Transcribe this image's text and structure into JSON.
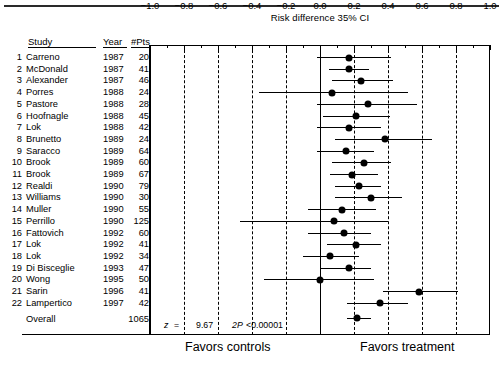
{
  "figure": {
    "title": "Risk difference 35% CI",
    "footer_left": "Favors controls",
    "footer_right": "Favors treatment",
    "overall_label": "Overall",
    "overall_pts": "1065",
    "stat_z_label": "z",
    "stat_eq": "=",
    "stat_z_value": "9.67",
    "stat_p_label": "2P",
    "stat_p_value": "<0.00001"
  },
  "columns": {
    "study": "Study",
    "year": "Year",
    "pts": "#Pts"
  },
  "chart_data": {
    "type": "forest",
    "title": "Risk difference 35% CI",
    "xlabel": "",
    "ylabel": "",
    "xlim": [
      -1.0,
      1.0
    ],
    "xticks": [
      -1.0,
      -0.8,
      -0.6,
      -0.4,
      -0.2,
      0.0,
      0.2,
      0.4,
      0.6,
      0.8,
      1.0
    ],
    "xtick_labels": [
      "−1.0",
      "−0.8",
      "−0.6",
      "−0.4",
      "−0.2",
      "0.0",
      "0.2",
      "0.4",
      "0.6",
      "0.8",
      "1.0"
    ],
    "minor_ticks_between": 1,
    "grid": "vertical-dashed-at-major-ticks",
    "null_line": 0.0,
    "legend": "none",
    "favors_left": "Favors controls",
    "favors_right": "Favors treatment",
    "overall": {
      "label": "Overall",
      "n": 1065,
      "estimate": 0.22,
      "ci_low": 0.16,
      "ci_high": 0.3,
      "z": 9.67,
      "p": "<0.00001"
    },
    "rows": [
      {
        "n": 1,
        "study": "Carreno",
        "year": 1987,
        "pts": 20,
        "estimate": 0.17,
        "ci_low": -0.02,
        "ci_high": 0.42
      },
      {
        "n": 2,
        "study": "McDonald",
        "year": 1987,
        "pts": 41,
        "estimate": 0.17,
        "ci_low": 0.05,
        "ci_high": 0.29
      },
      {
        "n": 3,
        "study": "Alexander",
        "year": 1987,
        "pts": 46,
        "estimate": 0.24,
        "ci_low": 0.07,
        "ci_high": 0.43
      },
      {
        "n": 4,
        "study": "Porres",
        "year": 1988,
        "pts": 24,
        "estimate": 0.07,
        "ci_low": -0.36,
        "ci_high": 0.52
      },
      {
        "n": 5,
        "study": "Pastore",
        "year": 1988,
        "pts": 28,
        "estimate": 0.28,
        "ci_low": -0.02,
        "ci_high": 0.57
      },
      {
        "n": 6,
        "study": "Hoofnagle",
        "year": 1988,
        "pts": 45,
        "estimate": 0.21,
        "ci_low": 0.02,
        "ci_high": 0.41
      },
      {
        "n": 7,
        "study": "Lok",
        "year": 1988,
        "pts": 42,
        "estimate": 0.17,
        "ci_low": -0.02,
        "ci_high": 0.36
      },
      {
        "n": 8,
        "study": "Brunetto",
        "year": 1989,
        "pts": 24,
        "estimate": 0.38,
        "ci_low": 0.09,
        "ci_high": 0.66
      },
      {
        "n": 9,
        "study": "Saracco",
        "year": 1989,
        "pts": 64,
        "estimate": 0.15,
        "ci_low": -0.02,
        "ci_high": 0.32
      },
      {
        "n": 10,
        "study": "Brook",
        "year": 1989,
        "pts": 60,
        "estimate": 0.26,
        "ci_low": 0.07,
        "ci_high": 0.42
      },
      {
        "n": 11,
        "study": "Brook",
        "year": 1989,
        "pts": 67,
        "estimate": 0.19,
        "ci_low": 0.06,
        "ci_high": 0.34
      },
      {
        "n": 12,
        "study": "Realdi",
        "year": 1990,
        "pts": 79,
        "estimate": 0.23,
        "ci_low": 0.09,
        "ci_high": 0.36
      },
      {
        "n": 13,
        "study": "Williams",
        "year": 1990,
        "pts": 30,
        "estimate": 0.3,
        "ci_low": 0.09,
        "ci_high": 0.48
      },
      {
        "n": 14,
        "study": "Muller",
        "year": 1990,
        "pts": 55,
        "estimate": 0.13,
        "ci_low": -0.07,
        "ci_high": 0.33
      },
      {
        "n": 15,
        "study": "Perrillo",
        "year": 1990,
        "pts": 125,
        "estimate": 0.08,
        "ci_low": -0.47,
        "ci_high": 0.4
      },
      {
        "n": 16,
        "study": "Fattovich",
        "year": 1992,
        "pts": 60,
        "estimate": 0.14,
        "ci_low": -0.07,
        "ci_high": 0.3
      },
      {
        "n": 17,
        "study": "Lok",
        "year": 1992,
        "pts": 41,
        "estimate": 0.21,
        "ci_low": 0.04,
        "ci_high": 0.36
      },
      {
        "n": 18,
        "study": "Lok",
        "year": 1992,
        "pts": 34,
        "estimate": 0.06,
        "ci_low": -0.1,
        "ci_high": 0.23
      },
      {
        "n": 19,
        "study": "Di Bisceglie",
        "year": 1993,
        "pts": 47,
        "estimate": 0.17,
        "ci_low": 0.0,
        "ci_high": 0.3
      },
      {
        "n": 20,
        "study": "Wong",
        "year": 1995,
        "pts": 50,
        "estimate": 0.0,
        "ci_low": -0.33,
        "ci_high": 0.32
      },
      {
        "n": 21,
        "study": "Sarin",
        "year": 1996,
        "pts": 41,
        "estimate": 0.58,
        "ci_low": 0.37,
        "ci_high": 0.81
      },
      {
        "n": 22,
        "study": "Lampertico",
        "year": 1997,
        "pts": 42,
        "estimate": 0.35,
        "ci_low": 0.16,
        "ci_high": 0.52
      }
    ]
  }
}
